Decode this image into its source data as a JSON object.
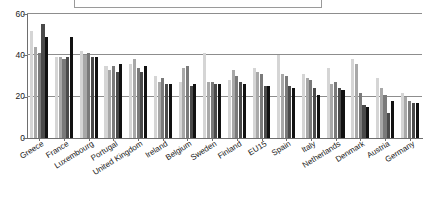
{
  "chart_data": {
    "type": "bar",
    "title": "",
    "xlabel": "",
    "ylabel": "",
    "ylim": [
      0,
      60
    ],
    "yticks": [
      0,
      20,
      40,
      60
    ],
    "grid": true,
    "legend_position": "top",
    "orientation": "vertical",
    "grouped": true,
    "categories": [
      "Greece",
      "France",
      "Luxembourg",
      "Portugal",
      "United Kingdom",
      "Ireland",
      "Belgium",
      "Sweden",
      "Finland",
      "EU15",
      "Spain",
      "Italy",
      "Netherlands",
      "Denmark",
      "Austria",
      "Germany"
    ],
    "series": [
      {
        "name": "series-1",
        "color": "#d5d5d5",
        "values": [
          52,
          39,
          42,
          35,
          36,
          30,
          27,
          41,
          28,
          34,
          40,
          31,
          34,
          38,
          29,
          22
        ]
      },
      {
        "name": "series-2",
        "color": "#a8a8a8",
        "values": [
          44,
          39,
          40,
          33,
          38,
          27,
          34,
          27,
          33,
          32,
          31,
          29,
          26,
          36,
          24,
          20
        ]
      },
      {
        "name": "series-3",
        "color": "#7a7a7a",
        "values": [
          41,
          38,
          41,
          35,
          34,
          29,
          35,
          27,
          30,
          31,
          30,
          28,
          27,
          22,
          21,
          18
        ]
      },
      {
        "name": "series-4",
        "color": "#4a4a4a",
        "values": [
          55,
          39,
          39,
          32,
          32,
          26,
          25,
          26,
          27,
          25,
          25,
          24,
          24,
          16,
          12,
          17
        ]
      },
      {
        "name": "series-5",
        "color": "#111111",
        "values": [
          49,
          49,
          39,
          36,
          35,
          26,
          26,
          26,
          26,
          25,
          24,
          21,
          23,
          15,
          18,
          17
        ]
      }
    ],
    "series_count": 5,
    "category_count": 16
  },
  "axes": {
    "y_tick_labels": [
      "60",
      "40",
      "20",
      "0"
    ]
  },
  "legend": {
    "visible": true,
    "clipped": true,
    "entries": []
  }
}
